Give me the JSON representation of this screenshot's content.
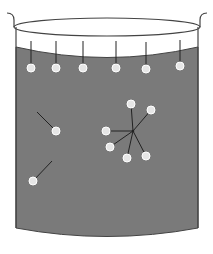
{
  "diagram": {
    "colors": {
      "background": "#ffffff",
      "liquid": "#7a7a7a",
      "outline": "#444444",
      "molecule_fill": "#e6e6e6",
      "molecule_stroke": "#ffffff",
      "bond": "#222222"
    },
    "beaker": {
      "rim": {
        "cx": 107,
        "cy": 27,
        "rx": 93,
        "ry": 9
      },
      "left_wall_x": 16,
      "right_wall_x": 198,
      "bottom_edge_y": 228,
      "bottom_center_y": 241
    },
    "surface_molecules": [
      {
        "x": 31,
        "y": 68,
        "stem_top": 41
      },
      {
        "x": 56,
        "y": 68,
        "stem_top": 41
      },
      {
        "x": 83,
        "y": 68,
        "stem_top": 41
      },
      {
        "x": 116,
        "y": 68,
        "stem_top": 41
      },
      {
        "x": 146,
        "y": 69,
        "stem_top": 42
      },
      {
        "x": 180,
        "y": 66,
        "stem_top": 40
      }
    ],
    "bulk_pairs": [
      {
        "x": 56,
        "y": 131,
        "lx": 37,
        "ly": 112
      },
      {
        "x": 33,
        "y": 181,
        "lx": 52,
        "ly": 161
      }
    ],
    "cluster": {
      "center": {
        "x": 133,
        "y": 131
      },
      "molecules": [
        {
          "x": 131,
          "y": 104
        },
        {
          "x": 151,
          "y": 110
        },
        {
          "x": 106,
          "y": 131
        },
        {
          "x": 110,
          "y": 147
        },
        {
          "x": 127,
          "y": 158
        },
        {
          "x": 146,
          "y": 156
        }
      ]
    }
  }
}
